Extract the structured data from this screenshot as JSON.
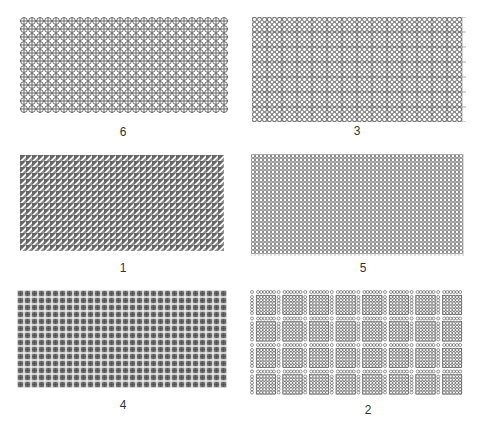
{
  "figure": {
    "panels": [
      {
        "id": "panel-6",
        "label": "6",
        "pattern": "circle-with-cross",
        "x": 20,
        "y": 17,
        "w": 209,
        "h": 101,
        "cell": 8,
        "label_x": 123,
        "label_y": 125
      },
      {
        "id": "panel-3",
        "label": "3",
        "pattern": "dense-circles-grid",
        "x": 252,
        "y": 17,
        "w": 214,
        "h": 105,
        "cell": 5,
        "label_x": 357,
        "label_y": 124
      },
      {
        "id": "panel-1",
        "label": "1",
        "pattern": "diagonal-triangles",
        "x": 20,
        "y": 155,
        "w": 209,
        "h": 98,
        "cell": 6,
        "label_x": 123,
        "label_y": 261
      },
      {
        "id": "panel-5",
        "label": "5",
        "pattern": "fine-circle-grid",
        "x": 251,
        "y": 154,
        "w": 215,
        "h": 102,
        "cell": 4,
        "label_x": 363,
        "label_y": 261
      },
      {
        "id": "panel-4",
        "label": "4",
        "pattern": "boxed-symbols",
        "x": 17,
        "y": 290,
        "w": 215,
        "h": 102,
        "cell": 7,
        "label_x": 123,
        "label_y": 398
      },
      {
        "id": "panel-2",
        "label": "2",
        "pattern": "block-groups-of-circles",
        "x": 250,
        "y": 290,
        "w": 213,
        "h": 106,
        "cell": 3.4,
        "label_x": 368,
        "label_y": 403
      }
    ]
  },
  "colors": {
    "ink": "#333333",
    "background": "#ffffff"
  }
}
